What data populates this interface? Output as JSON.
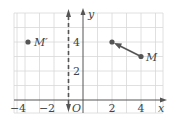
{
  "diagram": {
    "type": "coordinate-plane",
    "axes": {
      "x_label": "x",
      "y_label": "y",
      "origin_label": "O",
      "x_ticks": [
        {
          "value": -4,
          "label": "−4"
        },
        {
          "value": -2,
          "label": "−2"
        },
        {
          "value": 2,
          "label": "2"
        },
        {
          "value": 4,
          "label": "4"
        }
      ],
      "y_ticks": [
        {
          "value": 2,
          "label": "2"
        },
        {
          "value": 4,
          "label": "4"
        }
      ]
    },
    "points": [
      {
        "name": "M",
        "label": "M",
        "x": 4,
        "y": 3
      },
      {
        "name": "M-prime",
        "label": "M′",
        "x": -4,
        "y": 4
      },
      {
        "name": "image-point",
        "label": "",
        "x": 2,
        "y": 4
      }
    ],
    "arrow": {
      "from": [
        4,
        3
      ],
      "to": [
        2,
        4
      ]
    },
    "dashed_line": {
      "x": -1,
      "style": "dashed",
      "arrows": "both"
    },
    "colors": {
      "grid": "#d6d6d6",
      "axis": "#555555",
      "point": "#555555",
      "text": "#444444"
    }
  }
}
